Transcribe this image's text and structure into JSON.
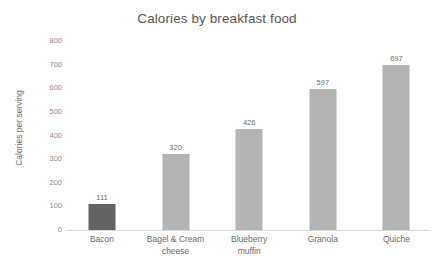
{
  "chart_data": {
    "type": "bar",
    "title": "Calories by breakfast food",
    "xlabel": "",
    "ylabel": "Calories per serving",
    "categories": [
      "Bacon",
      "Bagel & Cream cheese",
      "Blueberry muffin",
      "Granola",
      "Quiche"
    ],
    "values": [
      111,
      320,
      426,
      597,
      697
    ],
    "value_labels": [
      "111",
      "320",
      "426",
      "597",
      "697"
    ],
    "ylim": [
      0,
      800
    ],
    "ytick_labels": [
      "800",
      "700",
      "600",
      "500",
      "400",
      "300",
      "200",
      "100",
      "0"
    ],
    "ytick_values": [
      800,
      700,
      600,
      500,
      400,
      300,
      200,
      100,
      0
    ],
    "grid": false,
    "legend": false,
    "bar_colors": [
      "#636363",
      "#b3b3b3",
      "#b3b3b3",
      "#b3b3b3",
      "#b3b3b3"
    ],
    "background_color": "#ffffff",
    "title_color": "#595959",
    "axis_text_color": "#6b6b6b",
    "axis_line_color": "#d9d9d9"
  },
  "category_lines": [
    [
      "Bacon"
    ],
    [
      "Bagel & Cream",
      "cheese"
    ],
    [
      "Blueberry",
      "muffin"
    ],
    [
      "Granola"
    ],
    [
      "Quiche"
    ]
  ]
}
